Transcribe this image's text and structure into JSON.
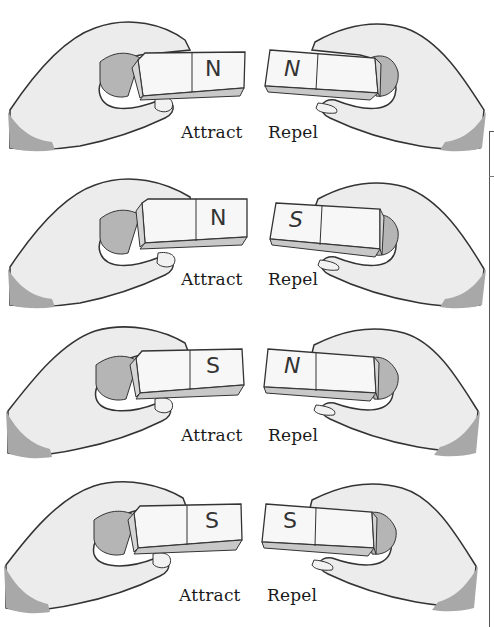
{
  "figure": {
    "title": "",
    "rows": [
      {
        "left_pole": "N",
        "right_pole": "N",
        "left_label": "Attract",
        "right_label": "Repel"
      },
      {
        "left_pole": "N",
        "right_pole": "S",
        "left_label": "Attract",
        "right_label": "Repel"
      },
      {
        "left_pole": "S",
        "right_pole": "N",
        "left_label": "Attract",
        "right_label": "Repel"
      },
      {
        "left_pole": "S",
        "right_pole": "S",
        "left_label": "Attract",
        "right_label": "Repel"
      }
    ]
  },
  "colors": {
    "skin": "#ececec",
    "outline": "#333333",
    "shadow": "#b5b5b5",
    "magnet_face": "#f7f7f7",
    "magnet_bottom": "#c8c8c8",
    "cuff": "#a8a8a8"
  }
}
